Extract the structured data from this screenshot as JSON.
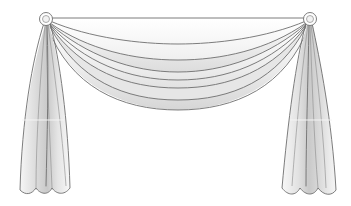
{
  "figure": {
    "title": "Swag and jabot window drapery illustration",
    "style": "line drawing with soft grey shading",
    "colors": {
      "background": "#ffffff",
      "outline": "#6e6e6e",
      "shade_dark": "#c8c8c8",
      "shade_mid": "#dedede",
      "shade_light": "#f2f2f2"
    },
    "elements": {
      "left_rosette": "left-rosette-holdback",
      "right_rosette": "right-rosette-holdback",
      "swag": "center-swag-with-folds",
      "left_jabot": "left-side-panel",
      "right_jabot": "right-side-panel"
    },
    "swag_fold_count": 5,
    "panel_fold_count": 4
  }
}
